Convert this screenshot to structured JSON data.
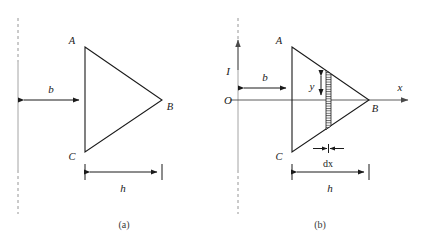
{
  "figure": {
    "background_color": "#ffffff",
    "line_color": "#1a1a1a",
    "axis_color": "#4a4a4a",
    "centerline_color": "#8a8a8a"
  },
  "panels": [
    {
      "id": "a",
      "caption": "(a)",
      "vertices": {
        "A": "A",
        "B": "B",
        "C": "C"
      },
      "dimensions": {
        "b": "b",
        "h": "h"
      },
      "geometry": {
        "centerline_x": 18,
        "apex_left_x": 85,
        "apex_top_y": 47,
        "apex_bottom_y": 152,
        "apex_right_x": 162,
        "apex_right_y": 100,
        "b_arrow_y": 100,
        "h_dim_y": 172
      }
    },
    {
      "id": "b",
      "caption": "(b)",
      "vertices": {
        "A": "A",
        "B": "B",
        "C": "C"
      },
      "dimensions": {
        "b": "b",
        "h": "h",
        "y": "y",
        "dx": "dx"
      },
      "axes": {
        "origin": "O",
        "vertical": "I",
        "horizontal": "x"
      },
      "geometry": {
        "centerline_x": 238,
        "apex_left_x": 292,
        "apex_top_y": 47,
        "apex_bottom_y": 152,
        "apex_right_x": 369,
        "axis_y": 100,
        "strip_x": 326,
        "strip_width": 5,
        "b_arrow_y": 88,
        "h_dim_y": 172,
        "x_axis_end": 408
      }
    }
  ]
}
